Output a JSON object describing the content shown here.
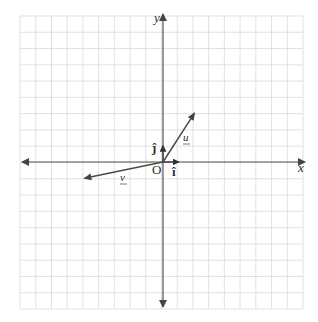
{
  "diagram": {
    "type": "vector-coordinate-plane",
    "grid": {
      "x_min": -9,
      "x_max": 9,
      "y_min": -9,
      "y_max": 9,
      "cells_x": 18,
      "cells_y": 18,
      "line_color": "#d9d9d9",
      "border_color": "#d0d0d0"
    },
    "axes": {
      "x_label": "x",
      "y_label": "y",
      "origin_label": "O",
      "color": "#555555"
    },
    "unit_vectors": [
      {
        "name": "i-hat",
        "label": "î",
        "x": 1,
        "y": 0
      },
      {
        "name": "j-hat",
        "label": "ĵ",
        "x": 0,
        "y": 1
      }
    ],
    "vectors": [
      {
        "name": "u",
        "label": "u",
        "x": 2,
        "y": 3,
        "color": "#4a4a4a",
        "underlined": true
      },
      {
        "name": "v",
        "label": "v",
        "x": -5,
        "y": -1,
        "color": "#4a4a4a",
        "underlined": true
      }
    ]
  }
}
